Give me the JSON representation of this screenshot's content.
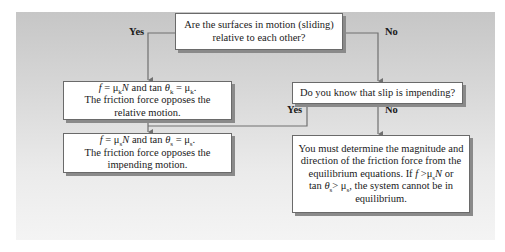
{
  "diagram": {
    "type": "flowchart",
    "colors": {
      "panel_top": "#c6c6c6",
      "panel_bottom": "#f4f4f4",
      "box_fill": "#ffffff",
      "line": "#707070"
    },
    "nodes": {
      "q_motion": {
        "lines": [
          "Are the surfaces in motion (sliding)",
          "relative to each other?"
        ]
      },
      "kinetic": {
        "formula": {
          "f": "f",
          "eq1": " = μ",
          "sub1": "k",
          "n": "N",
          "and": " and tan ",
          "theta": "θ",
          "sub2": "k",
          "eq2": " = μ",
          "sub3": "k",
          "end": "."
        },
        "lines": [
          "The friction force opposes the",
          "relative motion."
        ]
      },
      "q_impending": {
        "lines": [
          "Do you know that slip is impending?"
        ]
      },
      "static": {
        "formula": {
          "f": "f",
          "eq1": " = μ",
          "sub1": "s",
          "n": "N",
          "and": " and tan ",
          "theta": "θ",
          "sub2": "s",
          "eq2": " = μ",
          "sub3": "s",
          "end": "."
        },
        "lines": [
          "The friction force opposes the",
          "impending motion."
        ]
      },
      "equilibrium": {
        "lines": [
          "You must determine the magnitude and",
          "direction of the friction force from the"
        ],
        "line3": {
          "pre": "equilibrium equations. If ",
          "f": "f",
          "gt": " >μ",
          "sub": "s",
          "n": "N",
          "post": " or"
        },
        "line4": {
          "pre": "tan ",
          "theta": "θ",
          "sub1": "s",
          "gt": "> μ",
          "sub2": "s",
          "post": ", the system cannot be in"
        },
        "line5": "equilibrium."
      }
    },
    "edges": [
      {
        "from": "q_motion",
        "to": "kinetic",
        "label": "Yes"
      },
      {
        "from": "q_motion",
        "to": "q_impending",
        "label": "No"
      },
      {
        "from": "q_impending",
        "to": "static",
        "label": "Yes"
      },
      {
        "from": "q_impending",
        "to": "equilibrium",
        "label": "No"
      },
      {
        "from": "kinetic",
        "to": "static",
        "label": ""
      }
    ]
  }
}
